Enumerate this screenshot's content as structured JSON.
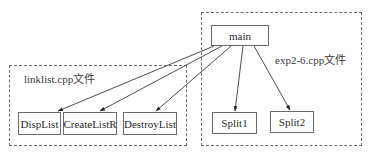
{
  "diagram": {
    "groups": [
      {
        "id": "linklist",
        "label": "linklist.cpp文件"
      },
      {
        "id": "exp",
        "label": "exp2-6.cpp文件"
      }
    ],
    "nodes": {
      "main": "main",
      "displist": "DispList",
      "createlistr": "CreateListR",
      "destroylist": "DestroyList",
      "split1": "Split1",
      "split2": "Split2"
    },
    "edges": [
      {
        "from": "main",
        "to": "DispList"
      },
      {
        "from": "main",
        "to": "CreateListR"
      },
      {
        "from": "main",
        "to": "DestroyList"
      },
      {
        "from": "main",
        "to": "Split1"
      },
      {
        "from": "main",
        "to": "Split2"
      }
    ],
    "colors": {
      "line": "#3a3a3a",
      "dashed_border": "#6e6e6e",
      "node_border": "#6a6a6a"
    }
  }
}
